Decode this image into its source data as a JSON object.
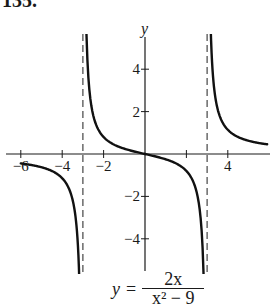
{
  "problem": {
    "number_label": "135."
  },
  "chart_data": {
    "type": "line",
    "title": "",
    "function": "y = 2x / (x^2 - 9)",
    "equation_label": {
      "lhs": "y",
      "equals": "=",
      "numerator": "2x",
      "denominator": "x² − 9"
    },
    "xlabel": "",
    "ylabel": "y",
    "xlim": [
      -6.3,
      5.7
    ],
    "ylim": [
      -5.5,
      5.5
    ],
    "x_ticks": [
      -6,
      -4,
      -2,
      2,
      4
    ],
    "x_tick_labels": [
      "−6",
      "−4",
      "−2",
      "",
      "4"
    ],
    "y_ticks": [
      4,
      2,
      -2,
      -4
    ],
    "y_tick_labels": [
      "4",
      "2",
      "−2",
      "−4"
    ],
    "vertical_asymptotes": [
      -3,
      3
    ],
    "horizontal_asymptote": 0,
    "grid": false,
    "legend": null,
    "series": [
      {
        "name": "left branch",
        "x": [
          -6,
          -5.5,
          -5,
          -4.5,
          -4,
          -3.75,
          -3.5,
          -3.4,
          -3.3,
          -3.25,
          -3.2,
          -3.17
        ],
        "y": [
          -0.444,
          -0.518,
          -0.625,
          -0.8,
          -1.143,
          -1.481,
          -2.154,
          -2.667,
          -3.492,
          -4.0,
          -5.161,
          -5.53
        ]
      },
      {
        "name": "middle branch",
        "x": [
          -2.83,
          -2.8,
          -2.7,
          -2.5,
          -2,
          -1,
          0,
          1,
          2,
          2.5,
          2.7,
          2.8,
          2.83
        ],
        "y": [
          5.7,
          4.828,
          3.158,
          1.818,
          0.8,
          0.25,
          0,
          -0.25,
          -0.8,
          -1.818,
          -3.158,
          -4.828,
          -5.7
        ]
      },
      {
        "name": "right branch",
        "x": [
          3.17,
          3.2,
          3.25,
          3.3,
          3.4,
          3.5,
          3.75,
          4,
          4.5,
          5,
          5.5,
          5.9
        ],
        "y": [
          5.53,
          5.161,
          4.0,
          3.492,
          2.667,
          2.154,
          1.481,
          1.143,
          0.8,
          0.625,
          0.518,
          0.47
        ]
      }
    ]
  }
}
